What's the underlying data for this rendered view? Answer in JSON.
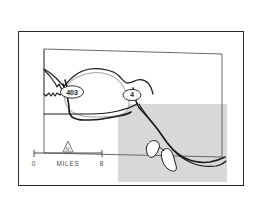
{
  "figure": {
    "kind": "map",
    "background_color": "#ffffff",
    "frame_color": "#2b2b2b"
  },
  "map": {
    "neatline_color": "#555555",
    "line_color": "#1a1a1a",
    "shaded_area": {
      "name": "shaded-region",
      "fill_color": "#d8d8d8"
    }
  },
  "route_shields": [
    {
      "name": "route-shield-403",
      "label": "403",
      "shape": "oval",
      "x": 72,
      "y": 92
    },
    {
      "name": "route-shield-4",
      "label": "4",
      "shape": "oval",
      "x": 132,
      "y": 95
    }
  ],
  "scale_bar": {
    "name": "scale-bar",
    "left_label": "0",
    "right_label": "8",
    "unit_label": "MILES",
    "text_color": "#4a4a4a"
  },
  "north_arrow": {
    "name": "north-arrow",
    "label": "N",
    "symbol": "triangle"
  }
}
